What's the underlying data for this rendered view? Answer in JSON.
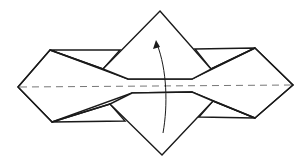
{
  "diagram": {
    "elements": [
      {
        "name": "model-outline",
        "kind": "paper model"
      },
      {
        "name": "valley-fold-line",
        "kind": "dashed horizontal fold line"
      },
      {
        "name": "fold-up-arrow",
        "kind": "curved arrow indicating fold upward"
      }
    ],
    "colors": {
      "line": "#1a1a1a",
      "fold_line": "#777777",
      "paper": "#ffffff"
    }
  }
}
